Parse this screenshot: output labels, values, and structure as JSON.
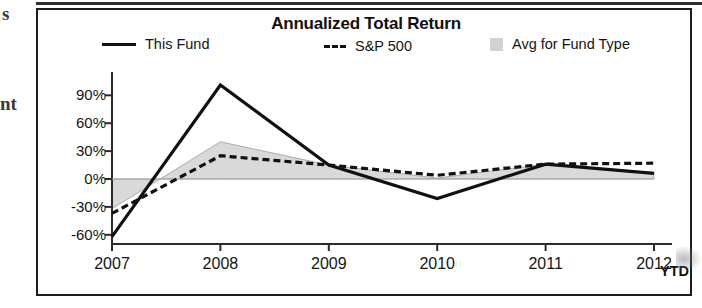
{
  "page": {
    "margin_marks": {
      "top": "s",
      "middle": "nt"
    }
  },
  "chart": {
    "title": "Annualized Total Return",
    "legend": [
      {
        "label": "This Fund",
        "marker": "solid-line-swatch",
        "color": "#111111"
      },
      {
        "label": "S&P 500",
        "marker": "dashed-line-swatch",
        "color": "#111111"
      },
      {
        "label": "Avg for Fund Type",
        "marker": "filled-area-swatch",
        "color": "#d2d2d2"
      }
    ],
    "x_axis_suffix_label": "YTD"
  },
  "chart_data": {
    "type": "line",
    "title": "Annualized Total Return",
    "xlabel": "",
    "ylabel": "",
    "x": [
      "2007",
      "2008",
      "2009",
      "2010",
      "2011",
      "2012"
    ],
    "categories": [
      "2007",
      "2008",
      "2009",
      "2010",
      "2011",
      "2012"
    ],
    "ytick_labels": [
      "90%",
      "60%",
      "30%",
      "0%",
      "-30%",
      "-60%"
    ],
    "ytick_values": [
      90,
      60,
      30,
      0,
      -30,
      -60
    ],
    "ylim": [
      -60,
      105
    ],
    "yunit": "%",
    "grid": false,
    "legend_position": "top",
    "series": [
      {
        "name": "This Fund",
        "style": "solid",
        "color": "#111111",
        "values": [
          -62,
          101,
          15,
          -21,
          16,
          6
        ]
      },
      {
        "name": "S&P 500",
        "style": "dashed",
        "color": "#111111",
        "values": [
          -37,
          25,
          15,
          4,
          16,
          17
        ]
      },
      {
        "name": "Avg for Fund Type",
        "style": "area",
        "color": "#d2d2d2",
        "values": [
          -32,
          40,
          15,
          1,
          16,
          7
        ],
        "baseline": 0
      }
    ],
    "annotations": [
      "YTD"
    ]
  }
}
